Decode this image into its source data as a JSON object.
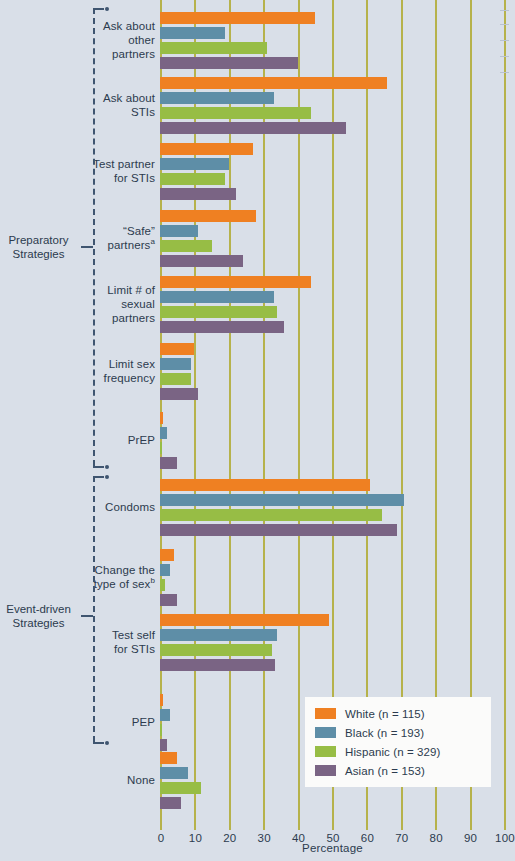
{
  "axis": {
    "x_title": "Percentage",
    "ticks": [
      0,
      10,
      20,
      30,
      40,
      50,
      60,
      70,
      80,
      90,
      100
    ]
  },
  "legend": {
    "entries": [
      {
        "label": "White (n = 115)",
        "color": "#ef8022"
      },
      {
        "label": "Black (n = 193)",
        "color": "#5e8ea7"
      },
      {
        "label": "Hispanic (n = 329)",
        "color": "#97bd45"
      },
      {
        "label": "Asian (n = 153)",
        "color": "#7a6484"
      }
    ]
  },
  "brackets": [
    {
      "label": "Preparatory\nStrategies"
    },
    {
      "label": "Event-driven\nStrategies"
    }
  ],
  "chart_data": {
    "type": "bar",
    "orientation": "horizontal",
    "title": "",
    "xlabel": "Percentage",
    "ylabel": "",
    "xlim": [
      0,
      100
    ],
    "grid": true,
    "legend_position": "bottom-right",
    "categories": [
      "Ask about\nother\npartners",
      "Ask about\nSTIs",
      "Test partner\nfor STIs",
      "“Safe”\npartnersᵃ",
      "Limit # of\nsexual\npartners",
      "Limit sex\nfrequency",
      "PrEP",
      "Condoms",
      "Change the\ntype of sexᵇ",
      "Test self\nfor STIs",
      "PEP",
      "None"
    ],
    "groups": [
      {
        "name": "Preparatory Strategies",
        "categories": [
          "Ask about other partners",
          "Ask about STIs",
          "Test partner for STIs",
          "“Safe” partners",
          "Limit # of sexual partners",
          "Limit sex frequency",
          "PrEP"
        ]
      },
      {
        "name": "Event-driven Strategies",
        "categories": [
          "Condoms",
          "Change the type of sex",
          "Test self for STIs",
          "PEP"
        ]
      }
    ],
    "series": [
      {
        "name": "White (n = 115)",
        "color": "#ef8022",
        "values": [
          45.0,
          66.0,
          27.0,
          28.0,
          44.0,
          10.0,
          1.0,
          61.0,
          4.0,
          49.0,
          1.0,
          5.0
        ]
      },
      {
        "name": "Black (n = 193)",
        "color": "#5e8ea7",
        "values": [
          19.0,
          33.0,
          20.0,
          11.0,
          33.0,
          9.0,
          2.0,
          71.0,
          3.0,
          34.0,
          3.0,
          8.0
        ]
      },
      {
        "name": "Hispanic (n = 329)",
        "color": "#97bd45",
        "values": [
          31.0,
          44.0,
          19.0,
          15.0,
          34.0,
          9.0,
          0.5,
          64.5,
          1.5,
          32.5,
          0.5,
          12.0
        ]
      },
      {
        "name": "Asian (n = 153)",
        "color": "#7a6484",
        "values": [
          40.0,
          54.0,
          22.0,
          24.0,
          36.0,
          11.0,
          5.0,
          69.0,
          5.0,
          33.5,
          2.0,
          6.0
        ]
      }
    ],
    "footnotes": [
      "a",
      "b"
    ]
  }
}
